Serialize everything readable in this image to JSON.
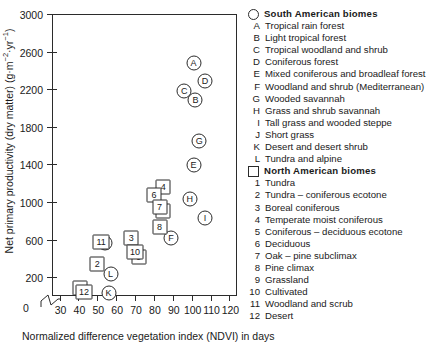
{
  "chart_data": {
    "type": "scatter",
    "title": "",
    "xlabel": "Normalized difference vegetation index (NDVI) in days",
    "ylabel_html": "Net primary productivity (dry matter) (g·m<sup>−2</sup>·yr<sup>−1</sup>)",
    "ylabel_text": "Net primary productivity (dry matter) (g·m-2·yr-1)",
    "xlim": [
      26,
      124
    ],
    "ylim": [
      0,
      3000
    ],
    "xticks": [
      30,
      40,
      50,
      60,
      70,
      80,
      90,
      100,
      110,
      120
    ],
    "yticks": [
      200,
      600,
      1000,
      1400,
      1800,
      2200,
      2600,
      3000
    ],
    "origin_label": "0",
    "axis_break": true,
    "grid": false,
    "legend_position": "right",
    "series": [
      {
        "name": "South American biomes",
        "marker": "circle",
        "points": [
          {
            "label": "A",
            "x": 101,
            "y": 2480
          },
          {
            "label": "B",
            "x": 102,
            "y": 2080
          },
          {
            "label": "C",
            "x": 96,
            "y": 2180
          },
          {
            "label": "D",
            "x": 107,
            "y": 2290
          },
          {
            "label": "E",
            "x": 101,
            "y": 1390
          },
          {
            "label": "F",
            "x": 89,
            "y": 620
          },
          {
            "label": "G",
            "x": 104,
            "y": 1650
          },
          {
            "label": "H",
            "x": 99,
            "y": 1030
          },
          {
            "label": "I",
            "x": 107,
            "y": 830
          },
          {
            "label": "J",
            "x": 54,
            "y": 560
          },
          {
            "label": "K",
            "x": 56,
            "y": 30
          },
          {
            "label": "L",
            "x": 57,
            "y": 230
          }
        ]
      },
      {
        "name": "North American biomes",
        "marker": "square",
        "points": [
          {
            "label": "1",
            "x": 41,
            "y": 90
          },
          {
            "label": "2",
            "x": 50,
            "y": 340
          },
          {
            "label": "3",
            "x": 68,
            "y": 620
          },
          {
            "label": "4",
            "x": 85,
            "y": 1160
          },
          {
            "label": "5",
            "x": 85,
            "y": 900
          },
          {
            "label": "6",
            "x": 80,
            "y": 1070
          },
          {
            "label": "7",
            "x": 83,
            "y": 950
          },
          {
            "label": "8",
            "x": 83,
            "y": 730
          },
          {
            "label": "9",
            "x": 72,
            "y": 420
          },
          {
            "label": "10",
            "x": 70,
            "y": 470
          },
          {
            "label": "11",
            "x": 52,
            "y": 570
          },
          {
            "label": "12",
            "x": 43,
            "y": 40
          }
        ]
      }
    ]
  },
  "legend": {
    "south": {
      "header": "South American biomes",
      "symbol": "circle-marker",
      "items": [
        {
          "key": "A",
          "text": "Tropical rain forest"
        },
        {
          "key": "B",
          "text": "Light tropical forest"
        },
        {
          "key": "C",
          "text": "Tropical woodland and shrub"
        },
        {
          "key": "D",
          "text": "Coniferous forest"
        },
        {
          "key": "E",
          "text": "Mixed coniferous and broadleaf forest"
        },
        {
          "key": "F",
          "text": "Woodland and shrub (Mediterranean)"
        },
        {
          "key": "G",
          "text": "Wooded savannah"
        },
        {
          "key": "H",
          "text": "Grass and shrub savannah"
        },
        {
          "key": "I",
          "text": "Tall grass and wooded steppe"
        },
        {
          "key": "J",
          "text": "Short grass"
        },
        {
          "key": "K",
          "text": "Desert and desert shrub"
        },
        {
          "key": "L",
          "text": "Tundra and alpine"
        }
      ]
    },
    "north": {
      "header": "North American biomes",
      "symbol": "square-marker",
      "items": [
        {
          "key": "1",
          "text": "Tundra"
        },
        {
          "key": "2",
          "text": "Tundra – coniferous ecotone"
        },
        {
          "key": "3",
          "text": "Boreal coniferous"
        },
        {
          "key": "4",
          "text": "Temperate moist coniferous"
        },
        {
          "key": "5",
          "text": "Coniferous – deciduous ecotone"
        },
        {
          "key": "6",
          "text": "Deciduous"
        },
        {
          "key": "7",
          "text": "Oak – pine subclimax"
        },
        {
          "key": "8",
          "text": "Pine climax"
        },
        {
          "key": "9",
          "text": "Grassland"
        },
        {
          "key": "10",
          "text": "Cultivated"
        },
        {
          "key": "11",
          "text": "Woodland and scrub"
        },
        {
          "key": "12",
          "text": "Desert"
        }
      ]
    }
  },
  "colors": {
    "axis": "#2b2b2b",
    "text": "#1a1a1a",
    "background": "#ffffff"
  }
}
